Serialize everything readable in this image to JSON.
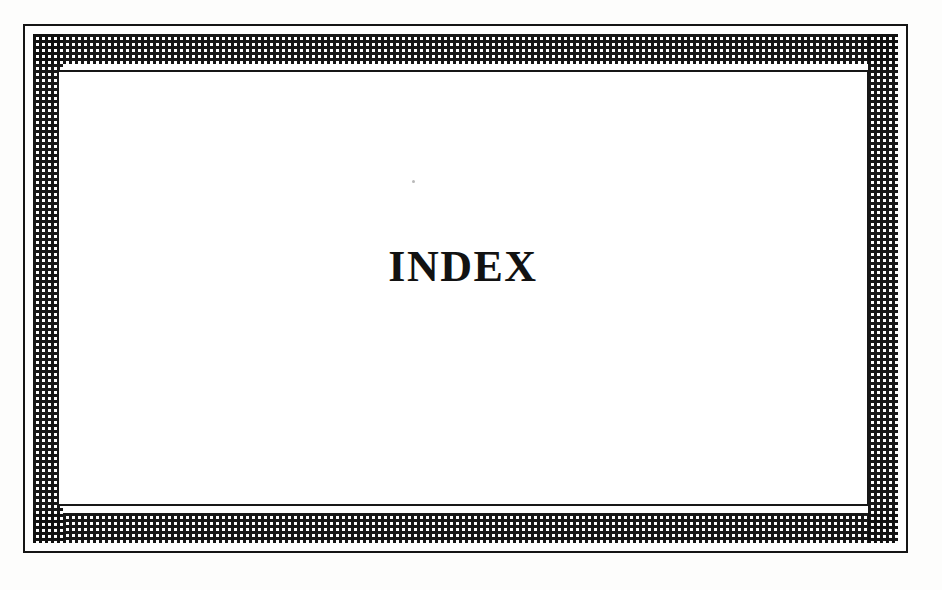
{
  "document": {
    "kind": "scanned-book-page",
    "page_background": "#fdfdfc",
    "ink_color": "#121212"
  },
  "frame": {
    "outer_rule": {
      "name": "outer-border-rule",
      "color": "#151515",
      "thickness_px": 2
    },
    "ornament_band": {
      "name": "checkerboard-ornament-band",
      "pattern": "woven-checkerboard",
      "cell_px": 3,
      "dark_color": "#101010",
      "light_color": "#ffffff",
      "thickness_px": 30
    },
    "inner_rule": {
      "name": "inner-border-rule",
      "color": "#171717",
      "thickness_px": 2
    }
  },
  "content": {
    "heading": "INDEX",
    "heading_style": "bold-serif-uppercase"
  },
  "artifacts": {
    "speck": "·"
  }
}
